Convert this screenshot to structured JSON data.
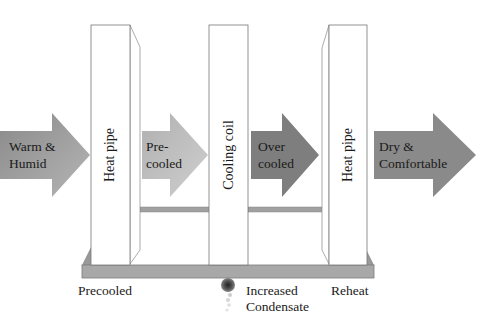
{
  "diagram": {
    "flow_arrows": [
      {
        "id": "warm-humid",
        "lines": [
          "Warm &",
          "Humid"
        ],
        "color": "#9a9a9a"
      },
      {
        "id": "pre-cooled",
        "lines": [
          "Pre-",
          "cooled"
        ],
        "color": "#b8b8b8"
      },
      {
        "id": "over-cooled",
        "lines": [
          "Over",
          "cooled"
        ],
        "color": "#808080"
      },
      {
        "id": "dry-comfortable",
        "lines": [
          "Dry &",
          "Comfortable"
        ],
        "color": "#8a8a8a"
      }
    ],
    "panels": [
      {
        "id": "heat-pipe-left",
        "label": "Heat pipe"
      },
      {
        "id": "cooling-coil",
        "label": "Cooling coil"
      },
      {
        "id": "heat-pipe-right",
        "label": "Heat pipe"
      }
    ],
    "bottom_labels": {
      "precooled": "Precooled",
      "condensate_line1": "Increased",
      "condensate_line2": "Condensate",
      "reheat": "Reheat"
    },
    "colors": {
      "base_bar": "#a8a8a8",
      "connector_bar": "#a0a0a0",
      "panel_border": "#777777",
      "drain": "#555555"
    }
  }
}
